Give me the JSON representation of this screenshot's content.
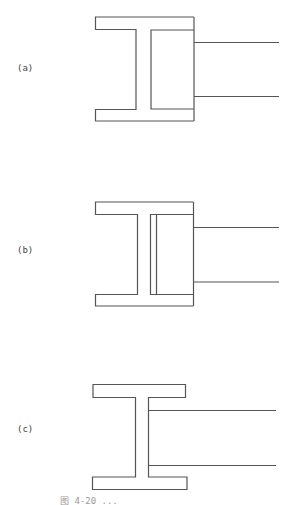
{
  "figure": {
    "stroke_color": "#555555",
    "background": "#ffffff",
    "panels": [
      {
        "id": "a",
        "label": "(a)",
        "description": "Half I-section: left flange ends with web, right side closed by vertical plate; two horizontal lines extend right"
      },
      {
        "id": "b",
        "label": "(b)",
        "description": "Same as (a) with additional plate line parallel to the web on the right side"
      },
      {
        "id": "c",
        "label": "(c)",
        "description": "Full I-section with two horizontal lines extending right from the web"
      }
    ],
    "caption": "图 4-20  ..."
  }
}
